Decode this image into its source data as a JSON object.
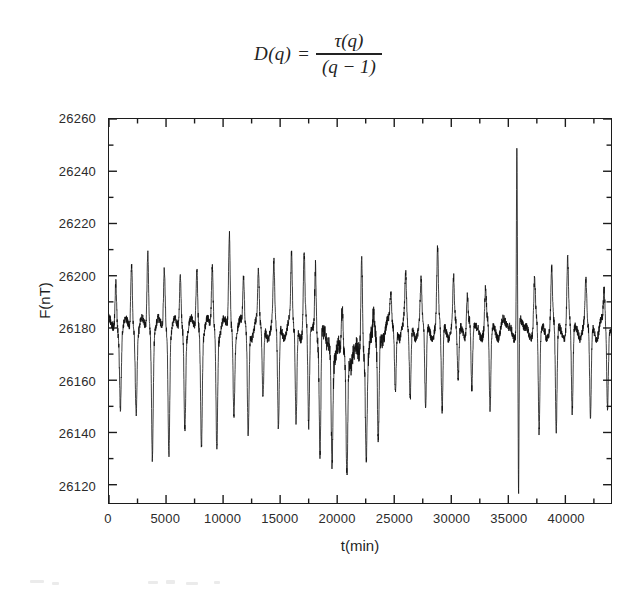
{
  "equation": {
    "lhs": "D(q)",
    "equals": "=",
    "numerator": "τ(q)",
    "denominator": "(q − 1)"
  },
  "figure": {
    "axis_color": "#1c1c1c",
    "line_color": "#101010",
    "background": "#ffffff"
  },
  "chart_data": {
    "type": "line",
    "title": "",
    "xlabel": "t(min)",
    "ylabel": "F(nT)",
    "xlim": [
      0,
      44000
    ],
    "ylim": [
      26113,
      26260
    ],
    "xticks": [
      0,
      5000,
      10000,
      15000,
      20000,
      25000,
      30000,
      35000,
      40000
    ],
    "xtick_labels": [
      "0",
      "5000",
      "10000",
      "15000",
      "20000",
      "25000",
      "30000",
      "35000",
      "40000"
    ],
    "x_minor_step": 2500,
    "yticks": [
      26120,
      26140,
      26160,
      26180,
      26200,
      26220,
      26240,
      26260
    ],
    "ytick_labels": [
      "26120",
      "26140",
      "26160",
      "26180",
      "26200",
      "26220",
      "26240",
      "26260"
    ],
    "y_minor_step": 10,
    "grid": false,
    "legend": null,
    "series_name": "geomagnetic total field F",
    "baseline": 26180,
    "sampling_interval_min": 1,
    "cycles": [
      {
        "t_peak": 600,
        "peak": 26197,
        "t_trough": 1000,
        "trough": 26153
      },
      {
        "t_peak": 1980,
        "peak": 26204,
        "t_trough": 2380,
        "trough": 26151
      },
      {
        "t_peak": 3400,
        "peak": 26208,
        "t_trough": 3800,
        "trough": 26134
      },
      {
        "t_peak": 4850,
        "peak": 26202,
        "t_trough": 5250,
        "trough": 26135
      },
      {
        "t_peak": 6250,
        "peak": 26200,
        "t_trough": 6650,
        "trough": 26145
      },
      {
        "t_peak": 7700,
        "peak": 26202,
        "t_trough": 8100,
        "trough": 26138
      },
      {
        "t_peak": 9050,
        "peak": 26203,
        "t_trough": 9450,
        "trough": 26136
      },
      {
        "t_peak": 10550,
        "peak": 26216,
        "t_trough": 10950,
        "trough": 26150
      },
      {
        "t_peak": 11800,
        "peak": 26199,
        "t_trough": 12200,
        "trough": 26139
      },
      {
        "t_peak": 13100,
        "peak": 26200,
        "t_trough": 13500,
        "trough": 26153
      },
      {
        "t_peak": 14450,
        "peak": 26202,
        "t_trough": 14850,
        "trough": 26141
      },
      {
        "t_peak": 16000,
        "peak": 26206,
        "t_trough": 16400,
        "trough": 26144
      },
      {
        "t_peak": 17100,
        "peak": 26208,
        "t_trough": 17500,
        "trough": 26141
      },
      {
        "t_peak": 18100,
        "peak": 26205,
        "t_trough": 18500,
        "trough": 26133
      },
      {
        "t_peak": 19150,
        "peak": 26180,
        "t_trough": 19550,
        "trough": 26138
      },
      {
        "t_peak": 20450,
        "peak": 26197,
        "t_trough": 20850,
        "trough": 26135
      },
      {
        "t_peak": 22150,
        "peak": 26216,
        "t_trough": 22550,
        "trough": 26140
      },
      {
        "t_peak": 23200,
        "peak": 26190,
        "t_trough": 23600,
        "trough": 26139
      },
      {
        "t_peak": 24700,
        "peak": 26192,
        "t_trough": 25100,
        "trough": 26155
      },
      {
        "t_peak": 26000,
        "peak": 26198,
        "t_trough": 26400,
        "trough": 26152
      },
      {
        "t_peak": 27350,
        "peak": 26195,
        "t_trough": 27750,
        "trough": 26149
      },
      {
        "t_peak": 28800,
        "peak": 26207,
        "t_trough": 29200,
        "trough": 26148
      },
      {
        "t_peak": 30200,
        "peak": 26196,
        "t_trough": 30600,
        "trough": 26160
      },
      {
        "t_peak": 31400,
        "peak": 26194,
        "t_trough": 31800,
        "trough": 26154
      },
      {
        "t_peak": 33000,
        "peak": 26193,
        "t_trough": 33400,
        "trough": 26148
      },
      {
        "t_peak": 35750,
        "peak": 26250,
        "t_trough": 35900,
        "trough": 26115
      },
      {
        "t_peak": 37300,
        "peak": 26197,
        "t_trough": 37700,
        "trough": 26139
      },
      {
        "t_peak": 38800,
        "peak": 26200,
        "t_trough": 39200,
        "trough": 26140
      },
      {
        "t_peak": 40200,
        "peak": 26204,
        "t_trough": 40600,
        "trough": 26147
      },
      {
        "t_peak": 41800,
        "peak": 26195,
        "t_trough": 42200,
        "trough": 26146
      },
      {
        "t_peak": 43400,
        "peak": 26193,
        "t_trough": 43700,
        "trough": 26149
      }
    ]
  }
}
